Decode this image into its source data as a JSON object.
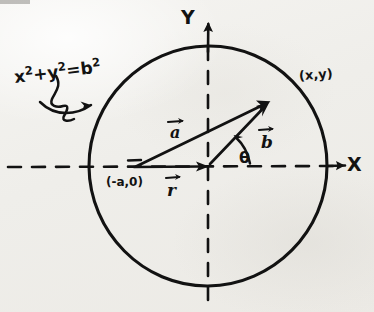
{
  "figure": {
    "kind": "hand-drawn-vector-geometry-diagram",
    "medium": "ink on paper, scanned",
    "paper_color": "#f2f1ee",
    "ink_color": "#121212"
  },
  "axes": {
    "x_label": "X",
    "x_arrow_icon": "arrow-right-icon",
    "y_label": "Y",
    "y_arrow_icon": "arrow-up-icon",
    "style": "dashed",
    "origin_px": [
      208,
      166
    ]
  },
  "circle": {
    "equation": "x",
    "equation_parts": {
      "x": "x",
      "x_exp": "2",
      "plus": "+",
      "y": "y",
      "y_exp": "2",
      "equals": "=",
      "b": "b",
      "b_exp": "2"
    },
    "equation_full": "x² + y² = b²",
    "center_px": [
      208,
      166
    ],
    "radius_px": 119,
    "callout_icon": "squiggly-arrow-icon"
  },
  "points": {
    "left_point_label": "(-a,0)",
    "left_point_px": [
      133,
      167
    ],
    "circle_point_label": "(x,y)",
    "circle_point_px": [
      271,
      100
    ]
  },
  "vectors": [
    {
      "name": "a",
      "label": "a",
      "accent": "arrow-over",
      "from_px": [
        133,
        167
      ],
      "to_px": [
        208,
        166
      ],
      "note": "from (-a,0) to the origin along the x-axis"
    },
    {
      "name": "r",
      "label": "r",
      "accent": "arrow-over",
      "from_px": [
        133,
        167
      ],
      "to_px": [
        271,
        100
      ],
      "note": "from (-a,0) to the point (x,y) on the circle"
    },
    {
      "name": "b",
      "label": "b",
      "accent": "arrow-over",
      "from_px": [
        208,
        166
      ],
      "to_px": [
        271,
        100
      ],
      "note": "radius from the origin to the point (x,y)"
    }
  ],
  "angle": {
    "label": "θ",
    "name": "theta",
    "vertex_px": [
      208,
      166
    ],
    "between": [
      "x-axis",
      "b"
    ],
    "arc_icon": "angle-arc-arrow-icon"
  }
}
